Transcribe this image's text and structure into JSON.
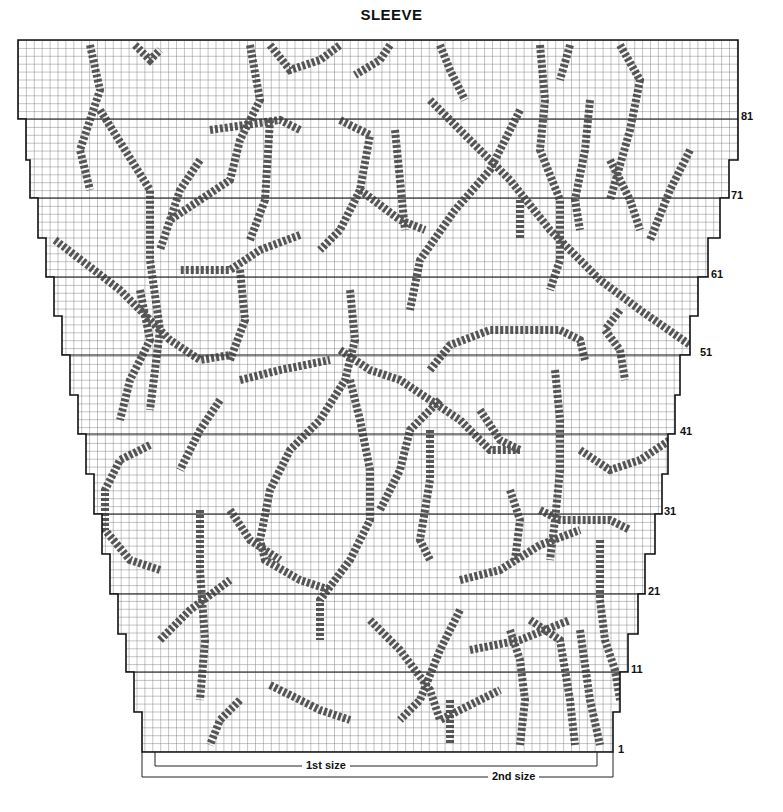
{
  "title": "SLEEVE",
  "chart": {
    "type": "knitting-chart",
    "symbol": "cross-stitch-x",
    "grid_cell_px": 8,
    "colors": {
      "grid": "#555555",
      "outline": "#111111",
      "stitch": "#333333",
      "background": "#ffffff"
    },
    "row_labels": [
      {
        "label": "81",
        "y": 119
      },
      {
        "label": "71",
        "y": 198
      },
      {
        "label": "61",
        "y": 277
      },
      {
        "label": "51",
        "y": 355
      },
      {
        "label": "41",
        "y": 434
      },
      {
        "label": "31",
        "y": 514
      },
      {
        "label": "21",
        "y": 594
      },
      {
        "label": "11",
        "y": 672
      },
      {
        "label": "1",
        "y": 752
      }
    ]
  },
  "size_brackets": {
    "first": "1st size",
    "second": "2nd size"
  }
}
